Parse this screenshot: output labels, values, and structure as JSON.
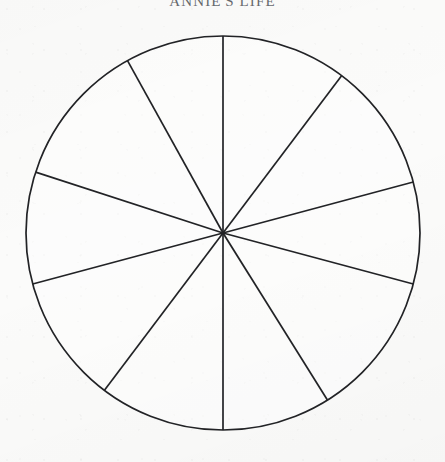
{
  "document": {
    "title": "ANNIE'S LIFE",
    "background_color": "#fbfbfa",
    "ink_color": "#222326"
  },
  "chart_data": {
    "type": "pie",
    "title": "ANNIE'S LIFE",
    "xlabel": "",
    "ylabel": "",
    "legend": "none",
    "grid": false,
    "labelled": false,
    "note": "Blank 'wheel of life' worksheet: unlabelled, unfilled pie divided into 10 sectors by radii drawn from the centre to the circumference.",
    "center_x": 223,
    "center_y": 233,
    "radius": 197,
    "slice_count": 10,
    "categories": [
      "sector-1",
      "sector-2",
      "sector-3",
      "sector-4",
      "sector-5",
      "sector-6",
      "sector-7",
      "sector-8",
      "sector-9",
      "sector-10"
    ],
    "values": [
      37,
      38,
      30,
      43,
      32,
      37,
      38,
      33,
      37,
      35
    ],
    "spoke_angles_deg": [
      -90,
      -53,
      -15,
      15,
      58,
      90,
      127,
      165,
      -162,
      -119
    ],
    "spoke_endpoints": [
      {
        "x": 223,
        "y": 36
      },
      {
        "x": 380,
        "y": 76
      },
      {
        "x": 413,
        "y": 182
      },
      {
        "x": 413,
        "y": 284
      },
      {
        "x": 327,
        "y": 400
      },
      {
        "x": 223,
        "y": 430
      },
      {
        "x": 104,
        "y": 390
      },
      {
        "x": 33,
        "y": 284
      },
      {
        "x": 36,
        "y": 172
      },
      {
        "x": 127,
        "y": 61
      }
    ]
  },
  "icons": {
    "circle": "circle-outline-icon",
    "spoke": "radius-line-icon"
  }
}
